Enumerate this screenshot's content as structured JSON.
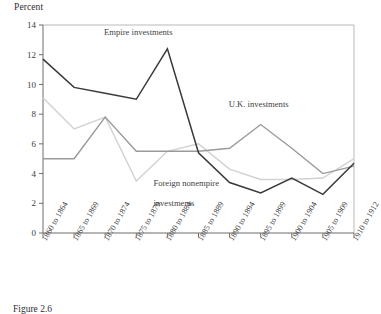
{
  "figure": {
    "caption": "Figure 2.6",
    "ylabel": "Percent"
  },
  "chart_data": {
    "type": "line",
    "title": "",
    "xlabel": "",
    "ylabel": "Percent",
    "ylim": [
      0,
      14
    ],
    "yticks": [
      0,
      2,
      4,
      6,
      8,
      10,
      12,
      14
    ],
    "grid": false,
    "legend_position": "inline-annotations",
    "categories": [
      "1860 to 1864",
      "1865 to 1869",
      "1870 to 1874",
      "1875 to 1879",
      "1880 to 1884",
      "1885 to 1889",
      "1890 to 1894",
      "1895 to 1899",
      "1900 to 1904",
      "1905 to 1909",
      "1910 to 1912"
    ],
    "series": [
      {
        "name": "Empire investments",
        "color": "#3a3a3a",
        "values": [
          11.7,
          9.8,
          9.4,
          9.0,
          12.4,
          5.4,
          3.4,
          2.7,
          3.7,
          2.6,
          4.7
        ],
        "label_x_index": 3,
        "label_value": 13.3
      },
      {
        "name": "U.K. investments",
        "color": "#9a9a9a",
        "values": [
          5.0,
          5.0,
          7.8,
          5.5,
          5.5,
          5.5,
          5.7,
          7.3,
          5.7,
          4.0,
          4.5
        ],
        "label_x_index": 7,
        "label_value": 8.5
      },
      {
        "name": "Foreign nonempire investments",
        "color": "#d2d2d2",
        "values": [
          9.1,
          7.0,
          7.8,
          3.5,
          5.5,
          6.0,
          4.3,
          3.6,
          3.6,
          3.7,
          5.0
        ],
        "label_x_index": 4,
        "label_value": 2.6
      }
    ],
    "annotations": [
      {
        "text": "Empire investments",
        "series": "Empire investments"
      },
      {
        "text": "U.K. investments",
        "series": "U.K. investments"
      },
      {
        "text": "Foreign nonempire",
        "series": "Foreign nonempire investments"
      },
      {
        "text": "investments",
        "series": "Foreign nonempire investments"
      }
    ]
  }
}
